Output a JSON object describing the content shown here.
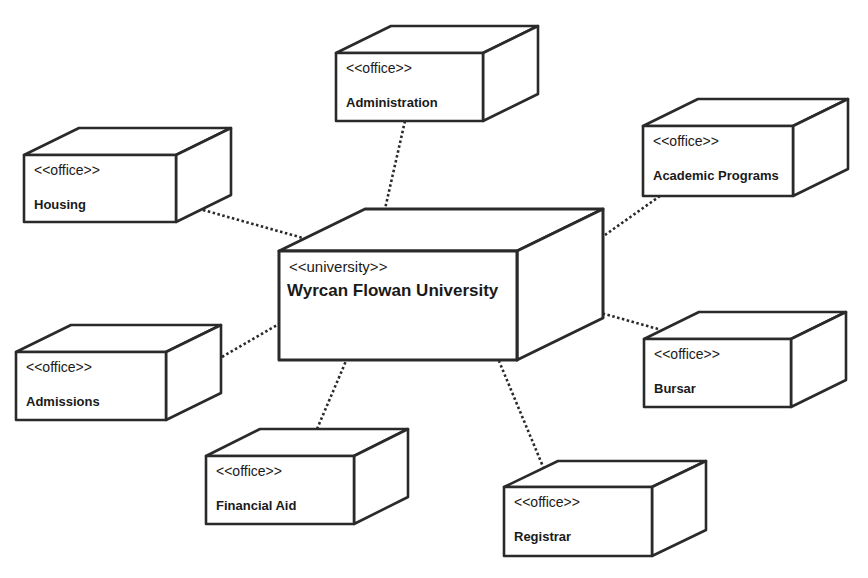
{
  "diagram": {
    "type": "UML deployment diagram",
    "colors": {
      "line": "#2a2a2a",
      "background": "#ffffff",
      "text": "#1a1a1a"
    },
    "center_node": {
      "id": "university",
      "stereotype": "<<university>>",
      "name": "Wyrcan Flowan University",
      "front": [
        279,
        251,
        517,
        360
      ],
      "depth": [
        86,
        -42
      ]
    },
    "nodes": [
      {
        "id": "administration",
        "stereotype": "<<office>>",
        "name": "Administration",
        "front": [
          336,
          53,
          483,
          121
        ],
        "depth": [
          55,
          -27
        ],
        "anchor": [
          405,
          121
        ],
        "hub": [
          385,
          209
        ]
      },
      {
        "id": "housing",
        "stereotype": "<<office>>",
        "name": "Housing",
        "front": [
          24,
          155,
          176,
          222
        ],
        "depth": [
          55,
          -27
        ],
        "anchor": [
          203,
          210
        ],
        "hub": [
          303,
          238
        ]
      },
      {
        "id": "academic-programs",
        "stereotype": "<<office>>",
        "name": "Academic Programs",
        "front": [
          643,
          126,
          793,
          196
        ],
        "depth": [
          55,
          -27
        ],
        "anchor": [
          660,
          196
        ],
        "hub": [
          605,
          235
        ]
      },
      {
        "id": "admissions",
        "stereotype": "<<office>>",
        "name": "Admissions",
        "front": [
          16,
          352,
          166,
          420
        ],
        "depth": [
          55,
          -27
        ],
        "anchor": [
          222,
          357
        ],
        "hub": [
          279,
          324
        ]
      },
      {
        "id": "bursar",
        "stereotype": "<<office>>",
        "name": "Bursar",
        "front": [
          644,
          339,
          791,
          407
        ],
        "depth": [
          55,
          -27
        ],
        "anchor": [
          658,
          329
        ],
        "hub": [
          601,
          313
        ]
      },
      {
        "id": "financial-aid",
        "stereotype": "<<office>>",
        "name": "Financial Aid",
        "front": [
          206,
          456,
          354,
          524
        ],
        "depth": [
          54,
          -27
        ],
        "anchor": [
          317,
          429
        ],
        "hub": [
          346,
          361
        ]
      },
      {
        "id": "registrar",
        "stereotype": "<<office>>",
        "name": "Registrar",
        "front": [
          504,
          487,
          652,
          556
        ],
        "depth": [
          54,
          -26
        ],
        "anchor": [
          544,
          469
        ],
        "hub": [
          499,
          361
        ]
      }
    ]
  }
}
